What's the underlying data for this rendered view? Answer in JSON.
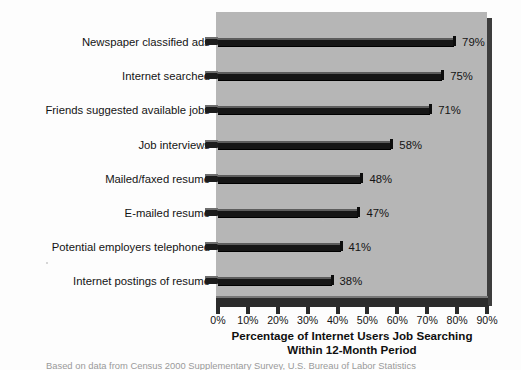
{
  "chart_data": {
    "type": "bar",
    "orientation": "horizontal",
    "title": "",
    "xlabel": "Percentage of Internet Users Job Searching Within 12-Month Period",
    "xlabel_line1": "Percentage of Internet Users Job Searching",
    "xlabel_line2": "Within 12-Month Period",
    "ylabel": "",
    "categories": [
      "Newspaper classified ads",
      "Internet searched",
      "Friends suggested available jobs",
      "Job interviews",
      "Mailed/faxed resume",
      "E-mailed resume",
      "Potential employers telephoned",
      "Internet postings of resume"
    ],
    "values": [
      79,
      75,
      71,
      58,
      48,
      47,
      41,
      38
    ],
    "value_labels": [
      "79%",
      "75%",
      "71%",
      "58%",
      "48%",
      "47%",
      "41%",
      "38%"
    ],
    "xlim": [
      0,
      90
    ],
    "xticks": [
      0,
      10,
      20,
      30,
      40,
      50,
      60,
      70,
      80,
      90
    ],
    "xtick_labels": [
      "0%",
      "10%",
      "20%",
      "30%",
      "40%",
      "50%",
      "60%",
      "70%",
      "80%",
      "90%"
    ],
    "grid": false,
    "legend": false,
    "colors": {
      "bar": "#161616",
      "plot_background": "#b6b6b6",
      "figure_background": "#fdfdfd",
      "axis": "#2b2b2b",
      "text": "#141414"
    }
  },
  "caption": {
    "text": "Based on data from Census 2000 Supplementary Survey, U.S. Bureau of Labor Statistics"
  }
}
